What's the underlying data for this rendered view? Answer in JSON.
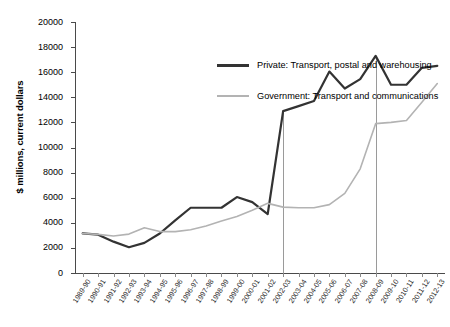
{
  "chart_data": {
    "type": "line",
    "title": "",
    "xlabel": "",
    "ylabel": "$ millions, current dollars",
    "ylim": [
      0,
      20000
    ],
    "ytick_step": 2000,
    "yticks": [
      "20000",
      "18000",
      "16000",
      "14000",
      "12000",
      "10000",
      "8000",
      "6000",
      "4000",
      "2000",
      "0"
    ],
    "grid": false,
    "legend_position": "inside-top-left",
    "categories": [
      "1989-90",
      "1990-91",
      "1991-92",
      "1992-93",
      "1993-94",
      "1994-95",
      "1995-96",
      "1996-97",
      "1997-98",
      "1998-99",
      "1999-00",
      "2000-01",
      "2001-02",
      "2002-03",
      "2003-04",
      "2004-05",
      "2005-06",
      "2006-07",
      "2007-08",
      "2008-09",
      "2009-10",
      "2010-11",
      "2011-12",
      "2012-13"
    ],
    "series": [
      {
        "name": "Private: Transport, postal and warehousing",
        "color": "#333333",
        "values": [
          3150,
          3050,
          2500,
          2050,
          2400,
          3150,
          4200,
          5200,
          5200,
          5200,
          6050,
          5650,
          4700,
          12900,
          13300,
          13700,
          16050,
          14700,
          15450,
          17300,
          15000,
          15000,
          16350,
          16500
        ]
      },
      {
        "name": "Government: Transport and communications",
        "color": "#b3b3b3",
        "values": [
          3150,
          3080,
          2950,
          3100,
          3600,
          3300,
          3300,
          3450,
          3750,
          4150,
          4500,
          5000,
          5550,
          5250,
          5200,
          5200,
          5450,
          6350,
          8300,
          11900,
          12000,
          12150,
          13600,
          15100
        ]
      }
    ],
    "reference_lines": [
      {
        "category": "2002-03"
      },
      {
        "category": "2008-09"
      }
    ]
  }
}
